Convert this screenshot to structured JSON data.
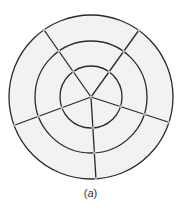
{
  "figure": {
    "caption_open": "(",
    "caption_var": "a",
    "caption_close": ")",
    "center": [
      91,
      97
    ],
    "rings": [
      {
        "name": "outer",
        "r": 82
      },
      {
        "name": "middle",
        "r": 56
      },
      {
        "name": "inner",
        "r": 31
      }
    ],
    "spokes": [
      {
        "name": "top-left",
        "end": [
          44,
          30
        ]
      },
      {
        "name": "top-right",
        "end": [
          139,
          30
        ]
      },
      {
        "name": "right",
        "end": [
          168,
          122
        ]
      },
      {
        "name": "bottom",
        "end": [
          96,
          180
        ]
      },
      {
        "name": "left",
        "end": [
          15,
          125
        ]
      }
    ],
    "colors": {
      "fill": "#f2f2f2",
      "stroke": "#2a2a2a",
      "node": "#b8b8b8"
    }
  }
}
